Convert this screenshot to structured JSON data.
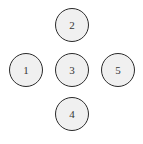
{
  "diagram": {
    "type": "node-graph",
    "layout": "cross",
    "background_color": "#ffffff",
    "node_fill_color": "#f0f0f0",
    "node_border_color": "#2b2b2b",
    "node_label_color": "#363636",
    "node_diameter": 34,
    "node_border_width": 1.5,
    "nodes": [
      {
        "id": "node-2",
        "label": "2",
        "cx": 72,
        "cy": 25,
        "position": "top"
      },
      {
        "id": "node-1",
        "label": "1",
        "cx": 26,
        "cy": 70,
        "position": "left"
      },
      {
        "id": "node-3",
        "label": "3",
        "cx": 72,
        "cy": 70,
        "position": "center"
      },
      {
        "id": "node-5",
        "label": "5",
        "cx": 118,
        "cy": 70,
        "position": "right"
      },
      {
        "id": "node-4",
        "label": "4",
        "cx": 72,
        "cy": 114,
        "position": "bottom"
      }
    ],
    "edges": []
  }
}
